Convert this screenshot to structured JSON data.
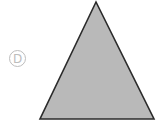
{
  "option": {
    "label": "D"
  },
  "shape": {
    "type": "triangle",
    "points": "96,2 40,119 154,119",
    "fill": "#b9b9b9",
    "stroke": "#2b2b2b"
  },
  "colors": {
    "label": "#bdbdbd",
    "background": "#ffffff"
  }
}
